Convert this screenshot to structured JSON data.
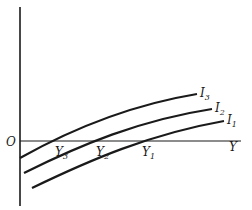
{
  "diagram": {
    "origin_label": "O",
    "x_axis_label": "Y",
    "curves": [
      {
        "name": "I",
        "sub": "3",
        "intercept_label": "Y",
        "intercept_sub": "3"
      },
      {
        "name": "I",
        "sub": "2",
        "intercept_label": "Y",
        "intercept_sub": "2"
      },
      {
        "name": "I",
        "sub": "1",
        "intercept_label": "Y",
        "intercept_sub": "1"
      }
    ],
    "colors": {
      "line": "#1a1a1a",
      "background": "#ffffff"
    }
  }
}
